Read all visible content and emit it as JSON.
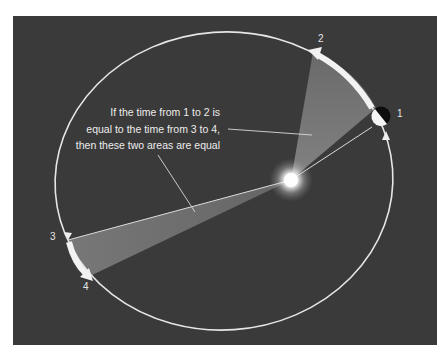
{
  "diagram": {
    "caption_lines": [
      "If the time from 1 to 2 is",
      "equal to the time from 3 to 4,",
      "then these two areas are equal"
    ],
    "position_labels": [
      "1",
      "2",
      "3",
      "4"
    ],
    "elements": {
      "orbit": "elliptical orbit",
      "sun": "sun (focus)",
      "planet": "planet at position 1",
      "area_near": "swept area 1-2 (near sun, wide)",
      "area_far": "swept area 3-4 (far from sun, narrow)",
      "arrow_near": "arc arrow from 1 to 2",
      "arrow_far": "arc arrow from 3 to 4"
    },
    "colors": {
      "background": "#3a3a3a",
      "orbit": "#e8e8e8",
      "swept_area": "#7a7a7a",
      "text": "#ececec",
      "page": "#ffffff"
    }
  }
}
